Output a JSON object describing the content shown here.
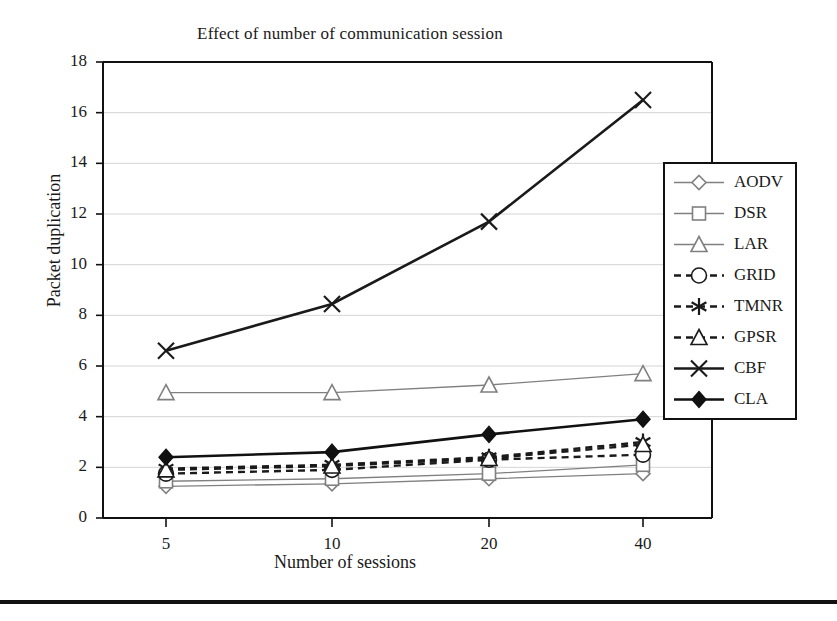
{
  "chart_data": {
    "type": "line",
    "title": "Effect of number of communication session",
    "xlabel": "Number of sessions",
    "ylabel": "Packet duplication",
    "categories": [
      "5",
      "10",
      "20",
      "40"
    ],
    "x": [
      5,
      10,
      20,
      40
    ],
    "ylim": [
      0,
      18
    ],
    "yticks": [
      "0",
      "2",
      "4",
      "6",
      "8",
      "10",
      "12",
      "14",
      "16",
      "18"
    ],
    "ytick_values": [
      0,
      2,
      4,
      6,
      8,
      10,
      12,
      14,
      16,
      18
    ],
    "grid": true,
    "legend_position": "right",
    "series": [
      {
        "name": "AODV",
        "marker": "diamond-open",
        "line": "solid",
        "color": "#808080",
        "values": [
          1.25,
          1.35,
          1.55,
          1.75
        ]
      },
      {
        "name": "DSR",
        "marker": "square-open",
        "line": "solid",
        "color": "#808080",
        "values": [
          1.45,
          1.55,
          1.75,
          2.1
        ]
      },
      {
        "name": "LAR",
        "marker": "triangle-open",
        "line": "solid",
        "color": "#808080",
        "values": [
          4.95,
          4.95,
          5.25,
          5.7
        ]
      },
      {
        "name": "GRID",
        "marker": "circle-open",
        "line": "dashed",
        "color": "#1a1a1a",
        "values": [
          1.75,
          1.9,
          2.3,
          2.5
        ]
      },
      {
        "name": "TMNR",
        "marker": "asterisk",
        "line": "dashed",
        "color": "#1a1a1a",
        "values": [
          1.95,
          2.1,
          2.4,
          3.0
        ]
      },
      {
        "name": "GPSR",
        "marker": "triangle-open",
        "line": "dashed",
        "color": "#1a1a1a",
        "values": [
          1.9,
          2.05,
          2.35,
          2.9
        ]
      },
      {
        "name": "CBF",
        "marker": "x-cross",
        "line": "solid",
        "color": "#1a1a1a",
        "values": [
          6.6,
          8.45,
          11.7,
          16.5
        ]
      },
      {
        "name": "CLA",
        "marker": "diamond-filled",
        "line": "solid",
        "color": "#111111",
        "values": [
          2.4,
          2.6,
          3.3,
          3.9
        ]
      }
    ]
  },
  "legend": {
    "items": [
      {
        "label": "AODV"
      },
      {
        "label": "DSR"
      },
      {
        "label": "LAR"
      },
      {
        "label": "GRID"
      },
      {
        "label": "TMNR"
      },
      {
        "label": "GPSR"
      },
      {
        "label": "CBF"
      },
      {
        "label": "CLA"
      }
    ]
  }
}
